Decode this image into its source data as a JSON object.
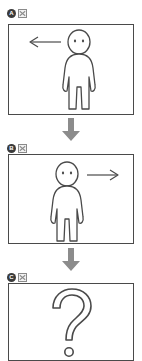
{
  "figure": {
    "background_color": "#ffffff",
    "stroke_color": "#4a4a4a",
    "arrow_color": "#8c8c8c",
    "badge_color": "#3b3b3b",
    "panels": [
      {
        "id": "panel-a",
        "label": "A",
        "glyph_name": "boxed-x-icon",
        "content": "person-facing-viewer-with-left-arrow",
        "arrow_direction": "left",
        "arrow_label": "←"
      },
      {
        "id": "panel-b",
        "label": "B",
        "glyph_name": "boxed-x-icon",
        "content": "person-facing-viewer-with-right-arrow",
        "arrow_direction": "right",
        "arrow_label": "→"
      },
      {
        "id": "panel-c",
        "label": "C",
        "glyph_name": "boxed-x-icon",
        "content": "question-mark",
        "arrow_direction": "none",
        "arrow_label": "?"
      }
    ],
    "connectors": [
      {
        "id": "connector-a-b",
        "direction": "down",
        "glyph": "⬇"
      },
      {
        "id": "connector-b-c",
        "direction": "down",
        "glyph": "⬇"
      }
    ]
  }
}
